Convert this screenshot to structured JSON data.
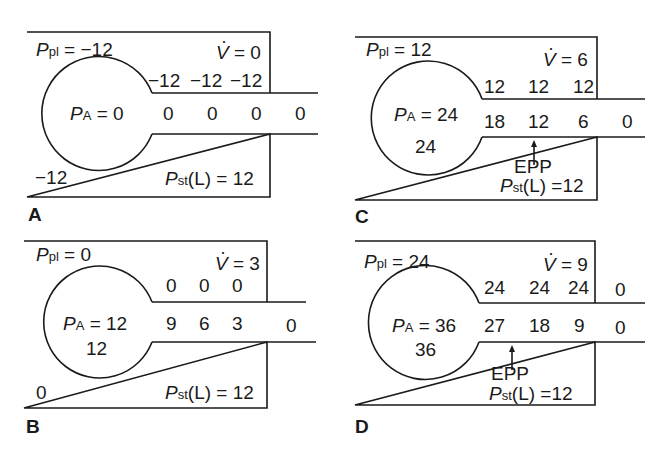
{
  "figure": {
    "panels": [
      {
        "label": "A",
        "ppl_symbol": "P",
        "ppl_sub": "pl",
        "ppl_value": "= −12",
        "vdot_value": "= 0",
        "pa_symbol": "P",
        "pa_sub": "A",
        "pa_value": "= 0",
        "alveolar_inner": "",
        "pleural_corner": "−12",
        "airway_wall": [
          "−12",
          "−12",
          "−12"
        ],
        "airway_outside_wall": "",
        "airway_lumen": [
          "0",
          "0",
          "0",
          "0"
        ],
        "epp": "",
        "pst_symbol": "P",
        "pst_sub": "st",
        "pst_value": "(L) = 12"
      },
      {
        "label": "B",
        "ppl_symbol": "P",
        "ppl_sub": "pl",
        "ppl_value": "= 0",
        "vdot_value": "= 3",
        "pa_symbol": "P",
        "pa_sub": "A",
        "pa_value": "= 12",
        "alveolar_inner": "12",
        "pleural_corner": "0",
        "airway_wall": [
          "0",
          "0",
          "0"
        ],
        "airway_outside_wall": "",
        "airway_lumen": [
          "9",
          "6",
          "3",
          "0"
        ],
        "epp": "",
        "pst_symbol": "P",
        "pst_sub": "st",
        "pst_value": "(L) = 12"
      },
      {
        "label": "C",
        "ppl_symbol": "P",
        "ppl_sub": "pl",
        "ppl_value": "= 12",
        "vdot_value": "= 6",
        "pa_symbol": "P",
        "pa_sub": "A",
        "pa_value": "= 24",
        "alveolar_inner": "24",
        "pleural_corner": "",
        "airway_wall": [
          "12",
          "12",
          "12"
        ],
        "airway_outside_wall": "",
        "airway_lumen": [
          "18",
          "12",
          "6",
          "0"
        ],
        "epp": "EPP",
        "pst_symbol": "P",
        "pst_sub": "st",
        "pst_value": "(L) =12"
      },
      {
        "label": "D",
        "ppl_symbol": "P",
        "ppl_sub": "pl",
        "ppl_value": "= 24",
        "vdot_value": "= 9",
        "pa_symbol": "P",
        "pa_sub": "A",
        "pa_value": "= 36",
        "alveolar_inner": "36",
        "pleural_corner": "",
        "airway_wall": [
          "24",
          "24",
          "24"
        ],
        "airway_outside_wall": "0",
        "airway_lumen": [
          "27",
          "18",
          "9",
          "0"
        ],
        "epp": "EPP",
        "pst_symbol": "P",
        "pst_sub": "st",
        "pst_value": "(L) =12"
      }
    ],
    "vdot_symbol": "V"
  }
}
